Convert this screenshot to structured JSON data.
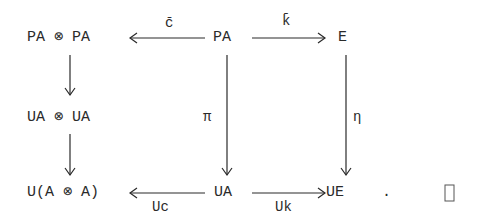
{
  "diagram": {
    "nodes": {
      "pa_tensor_pa": "PA ⊗ PA",
      "pa": "PA",
      "e": "E",
      "ua_tensor_ua": "UA ⊗ UA",
      "u_a_tensor_a": "U(A ⊗ A)",
      "ua": "UA",
      "ue": "UE"
    },
    "arrows": {
      "c_bar": "c̄",
      "k_bar": "k̄",
      "pi": "π",
      "eta": "η",
      "uc": "Uc",
      "uk": "Uk"
    },
    "period": ".",
    "qed": "□"
  }
}
